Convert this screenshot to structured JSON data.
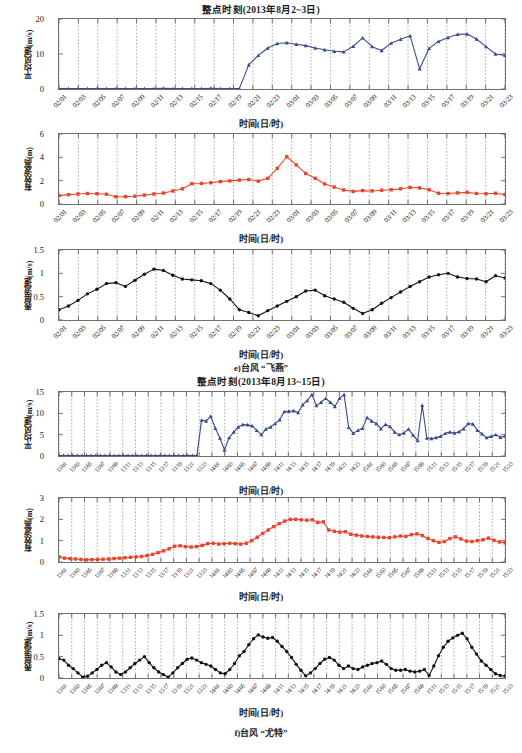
{
  "figure": {
    "captions": [
      {
        "id": "caption-e",
        "text": "e)台风 “飞燕”"
      },
      {
        "id": "caption-f",
        "text": "f)台风 “尤特”"
      }
    ],
    "axis_caption": "时间(日/时)"
  },
  "chart_data": [
    {
      "id": "chart-e-wind",
      "type": "line",
      "title": "整点时刻(2013年8月2~3日)",
      "xlabel": "时间(日/时)",
      "ylabel": "平均风速(m/s)",
      "ylim": [
        0,
        20
      ],
      "yticks": [
        0,
        10,
        20
      ],
      "grid": true,
      "legend": "none",
      "color": "#3a4a8c",
      "marker": "triangle",
      "tick_labels": [
        "02/01",
        "02/03",
        "02/05",
        "02/07",
        "02/09",
        "02/11",
        "02/13",
        "02/15",
        "02/17",
        "02/19",
        "02/21",
        "02/23",
        "03/01",
        "03/03",
        "03/05",
        "03/07",
        "03/09",
        "03/11",
        "03/13",
        "03/15",
        "03/17",
        "03/19",
        "03/21",
        "03/23"
      ],
      "x": [
        0,
        1,
        2,
        3,
        4,
        5,
        6,
        7,
        8,
        9,
        10,
        11,
        12,
        13,
        14,
        15,
        16,
        17,
        18,
        19,
        20,
        21,
        22,
        23,
        24,
        25,
        26,
        27,
        28,
        29,
        30,
        31,
        32,
        33,
        34,
        35,
        36,
        37,
        38,
        39,
        40,
        41,
        42,
        43,
        44,
        45,
        46,
        47
      ],
      "values": [
        0.1,
        0.1,
        0.1,
        0.1,
        0.1,
        0.1,
        0.1,
        0.1,
        0.1,
        0.1,
        0.1,
        0.2,
        0.1,
        0.1,
        0.1,
        0.1,
        0.2,
        0.1,
        0.1,
        0.1,
        6.9,
        9.6,
        11.7,
        13.0,
        13.2,
        12.8,
        12.4,
        11.7,
        11.2,
        10.8,
        10.6,
        12.2,
        14.6,
        12.1,
        11.0,
        13.1,
        14.2,
        15.2,
        5.8,
        11.6,
        13.6,
        14.7,
        15.6,
        15.7,
        14.3,
        12.1,
        10.0,
        9.6
      ]
    },
    {
      "id": "chart-e-wave",
      "type": "line",
      "title": "",
      "xlabel": "时间(日/时)",
      "ylabel": "有效波高(m)",
      "ylim": [
        0,
        6
      ],
      "yticks": [
        0,
        2,
        4,
        6
      ],
      "grid": true,
      "color": "#e8452c",
      "marker": "square",
      "tick_labels": [
        "02/01",
        "02/03",
        "02/05",
        "02/07",
        "02/09",
        "02/11",
        "02/13",
        "02/15",
        "02/17",
        "02/19",
        "02/21",
        "02/23",
        "03/01",
        "03/03",
        "03/05",
        "03/07",
        "03/09",
        "03/11",
        "03/13",
        "03/15",
        "03/17",
        "03/19",
        "03/21",
        "03/23"
      ],
      "values": [
        0.72,
        0.8,
        0.86,
        0.9,
        0.88,
        0.84,
        0.62,
        0.63,
        0.67,
        0.76,
        0.86,
        0.94,
        1.12,
        1.3,
        1.74,
        1.76,
        1.82,
        1.92,
        1.98,
        2.05,
        2.1,
        1.96,
        2.2,
        3.05,
        4.05,
        3.35,
        2.62,
        2.2,
        1.72,
        1.45,
        1.2,
        1.08,
        1.15,
        1.12,
        1.18,
        1.22,
        1.3,
        1.42,
        1.38,
        1.22,
        0.92,
        0.9,
        0.95,
        1.0,
        0.9,
        0.88,
        0.92,
        0.8
      ]
    },
    {
      "id": "chart-e-current",
      "type": "line",
      "title": "",
      "xlabel": "时间(日/时)",
      "ylabel": "表层流速(m/s)",
      "ylim": [
        0,
        1.5
      ],
      "yticks": [
        0,
        0.5,
        1,
        1.5
      ],
      "grid": true,
      "color": "#111111",
      "marker": "circle",
      "tick_labels": [
        "02/01",
        "02/03",
        "02/05",
        "02/07",
        "02/09",
        "02/11",
        "02/13",
        "02/15",
        "02/17",
        "02/19",
        "02/21",
        "02/23",
        "03/01",
        "03/03",
        "03/05",
        "03/07",
        "03/09",
        "03/11",
        "03/13",
        "03/15",
        "03/17",
        "03/19",
        "03/21",
        "03/23"
      ],
      "values": [
        0.22,
        0.3,
        0.42,
        0.56,
        0.66,
        0.78,
        0.8,
        0.72,
        0.85,
        0.98,
        1.09,
        1.06,
        0.96,
        0.88,
        0.86,
        0.84,
        0.78,
        0.64,
        0.45,
        0.22,
        0.16,
        0.09,
        0.2,
        0.3,
        0.4,
        0.5,
        0.62,
        0.64,
        0.52,
        0.45,
        0.38,
        0.25,
        0.14,
        0.22,
        0.36,
        0.48,
        0.6,
        0.72,
        0.82,
        0.92,
        0.97,
        1.0,
        0.92,
        0.89,
        0.88,
        0.82,
        0.95,
        0.9
      ]
    },
    {
      "id": "chart-f-wind",
      "type": "line",
      "title": "整点时刻(2013年8月13~15日)",
      "xlabel": "时间(日/时)",
      "ylabel": "平均风速(m/s)",
      "ylim": [
        0,
        15
      ],
      "yticks": [
        0,
        5,
        10,
        15
      ],
      "grid": true,
      "color": "#3a4a8c",
      "marker": "triangle",
      "tick_labels": [
        "13/01",
        "13/03",
        "13/05",
        "13/07",
        "13/09",
        "13/11",
        "13/13",
        "13/15",
        "13/17",
        "13/19",
        "13/21",
        "13/23",
        "14/01",
        "14/03",
        "14/05",
        "14/07",
        "14/09",
        "14/11",
        "14/13",
        "14/15",
        "14/17",
        "14/19",
        "14/21",
        "14/23",
        "15/01",
        "15/03",
        "15/05",
        "15/07",
        "15/09",
        "15/11",
        "15/13",
        "15/15",
        "15/17",
        "15/19",
        "15/21",
        "15/23"
      ],
      "values": [
        0.1,
        0.1,
        0.1,
        0.1,
        0.1,
        0.1,
        0.1,
        0.1,
        0.1,
        0.1,
        0.1,
        0.1,
        0.1,
        0.1,
        0.1,
        0.1,
        0.1,
        0.1,
        0.1,
        0.1,
        0.1,
        0.1,
        0.1,
        0.1,
        0.1,
        0.1,
        0.1,
        0.1,
        0.1,
        0.1,
        0.1,
        8.4,
        8.2,
        9.3,
        6.5,
        4.2,
        1.4,
        4.3,
        5.6,
        6.8,
        7.4,
        7.3,
        7.1,
        6.0,
        5.0,
        6.3,
        6.8,
        7.6,
        8.5,
        10.4,
        10.5,
        10.6,
        10.2,
        12.0,
        13.0,
        14.4,
        11.8,
        12.6,
        13.5,
        12.6,
        11.6,
        13.5,
        14.4,
        6.7,
        5.3,
        6.0,
        6.5,
        9.0,
        8.2,
        7.6,
        6.4,
        7.4,
        6.9,
        5.6,
        5.0,
        5.4,
        6.3,
        4.9,
        3.6,
        11.9,
        4.2,
        4.1,
        4.3,
        4.6,
        5.3,
        5.6,
        5.4,
        5.7,
        6.4,
        7.6,
        7.5,
        6.0,
        5.2,
        4.3,
        4.6,
        5.0,
        4.4,
        4.7
      ]
    },
    {
      "id": "chart-f-wave",
      "type": "line",
      "title": "",
      "xlabel": "时间(日/时)",
      "ylabel": "有效波高(m)",
      "ylim": [
        0,
        3
      ],
      "yticks": [
        0,
        1,
        2,
        3
      ],
      "grid": true,
      "color": "#e8452c",
      "marker": "square",
      "tick_labels": [
        "13/01",
        "13/03",
        "13/05",
        "13/07",
        "13/09",
        "13/11",
        "13/13",
        "13/15",
        "13/17",
        "13/19",
        "13/21",
        "13/23",
        "14/01",
        "14/03",
        "14/05",
        "14/07",
        "14/09",
        "14/11",
        "14/13",
        "14/15",
        "14/17",
        "14/19",
        "14/21",
        "14/23",
        "15/01",
        "15/03",
        "15/05",
        "15/07",
        "15/09",
        "15/11",
        "15/13",
        "15/15",
        "15/17",
        "15/19",
        "15/21",
        "15/23"
      ],
      "values": [
        0.24,
        0.18,
        0.16,
        0.14,
        0.12,
        0.1,
        0.11,
        0.12,
        0.13,
        0.14,
        0.16,
        0.18,
        0.2,
        0.22,
        0.24,
        0.26,
        0.3,
        0.36,
        0.44,
        0.52,
        0.62,
        0.74,
        0.76,
        0.72,
        0.7,
        0.72,
        0.78,
        0.86,
        0.88,
        0.84,
        0.86,
        0.88,
        0.86,
        0.84,
        0.88,
        1.0,
        1.16,
        1.34,
        1.5,
        1.66,
        1.8,
        1.92,
        2.0,
        2.0,
        1.98,
        1.96,
        1.98,
        1.86,
        1.88,
        1.5,
        1.44,
        1.4,
        1.42,
        1.3,
        1.26,
        1.22,
        1.2,
        1.18,
        1.16,
        1.15,
        1.14,
        1.18,
        1.22,
        1.2,
        1.28,
        1.32,
        1.24,
        1.1,
        1.0,
        0.92,
        0.96,
        1.1,
        1.18,
        1.08,
        0.98,
        0.96,
        1.0,
        1.04,
        1.12,
        1.02,
        0.94,
        0.9
      ]
    },
    {
      "id": "chart-f-current",
      "type": "line",
      "title": "",
      "xlabel": "时间(日/时)",
      "ylabel": "表层流速(m/s)",
      "ylim": [
        0,
        1.5
      ],
      "yticks": [
        0,
        0.5,
        1,
        1.5
      ],
      "grid": true,
      "color": "#111111",
      "marker": "circle",
      "tick_labels": [
        "13/01",
        "13/03",
        "13/05",
        "13/07",
        "13/09",
        "13/11",
        "13/13",
        "13/15",
        "13/17",
        "13/19",
        "13/21",
        "13/23",
        "14/01",
        "14/03",
        "14/05",
        "14/07",
        "14/09",
        "14/11",
        "14/13",
        "14/15",
        "14/17",
        "14/19",
        "14/21",
        "14/23",
        "15/01",
        "15/03",
        "15/05",
        "15/07",
        "15/09",
        "15/11",
        "15/13",
        "15/15",
        "15/17",
        "15/19",
        "15/21",
        "15/23"
      ],
      "values": [
        0.45,
        0.42,
        0.3,
        0.22,
        0.12,
        0.02,
        0.04,
        0.12,
        0.2,
        0.3,
        0.36,
        0.26,
        0.14,
        0.08,
        0.14,
        0.24,
        0.34,
        0.42,
        0.5,
        0.36,
        0.24,
        0.14,
        0.08,
        0.02,
        0.12,
        0.24,
        0.34,
        0.44,
        0.47,
        0.42,
        0.36,
        0.32,
        0.28,
        0.2,
        0.12,
        0.1,
        0.2,
        0.34,
        0.52,
        0.62,
        0.78,
        0.92,
        1.01,
        0.96,
        0.93,
        0.95,
        0.86,
        0.74,
        0.62,
        0.48,
        0.32,
        0.18,
        0.05,
        0.12,
        0.22,
        0.34,
        0.44,
        0.48,
        0.42,
        0.3,
        0.22,
        0.28,
        0.22,
        0.2,
        0.26,
        0.3,
        0.34,
        0.36,
        0.4,
        0.32,
        0.22,
        0.18,
        0.18,
        0.2,
        0.16,
        0.14,
        0.16,
        0.2,
        0.06,
        0.28,
        0.52,
        0.72,
        0.86,
        0.94,
        1.0,
        1.05,
        0.92,
        0.72,
        0.56,
        0.4,
        0.3,
        0.2,
        0.1,
        0.06,
        0.05
      ]
    }
  ]
}
